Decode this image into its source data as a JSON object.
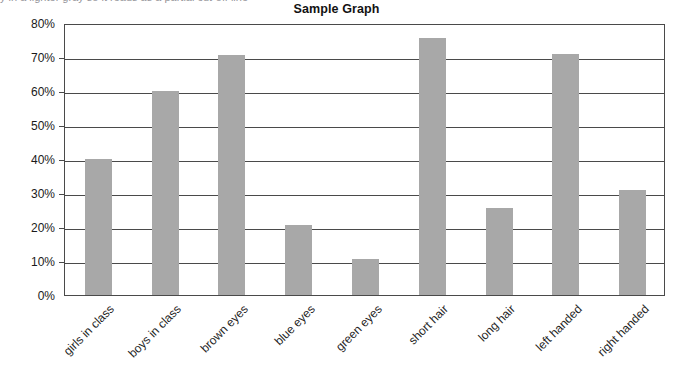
{
  "clipped_header_text": "y in a lighter gray so it reads as a partial cut-off line",
  "chart_data": {
    "type": "bar",
    "title": "Sample Graph",
    "xlabel": "",
    "ylabel": "",
    "categories": [
      "girls in class",
      "boys in class",
      "brown eyes",
      "blue eyes",
      "green eyes",
      "short hair",
      "long hair",
      "left handed",
      "right handed"
    ],
    "values": [
      40,
      60,
      70.5,
      20.5,
      10.5,
      75.5,
      25.5,
      71,
      31
    ],
    "value_labels": [
      "40%",
      "60%",
      "70.5%",
      "20.5%",
      "10.5%",
      "75.5%",
      "25.5%",
      "71%",
      "31%"
    ],
    "ylim": [
      0,
      80
    ],
    "ytick_values": [
      0,
      10,
      20,
      30,
      40,
      50,
      60,
      70,
      80
    ],
    "ytick_labels": [
      "0%",
      "10%",
      "20%",
      "30%",
      "40%",
      "50%",
      "60%",
      "70%",
      "80%"
    ],
    "grid": true,
    "grid_axis": "y",
    "legend": false,
    "legend_position": "none",
    "bar_color": "#a8a8a8",
    "axis_color": "#4a4a4a",
    "background_color": "#ffffff",
    "xtick_label_rotation": -45
  }
}
